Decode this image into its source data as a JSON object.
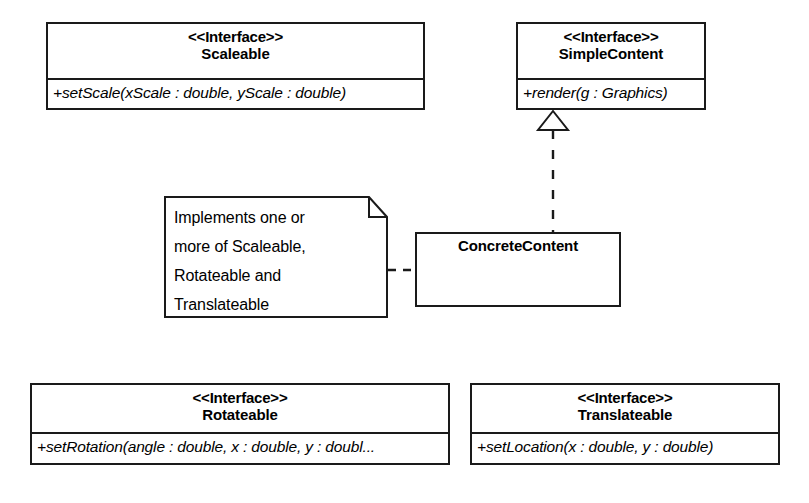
{
  "diagram": {
    "background_color": "#ffffff",
    "line_color": "#1a1a1a"
  },
  "classes": {
    "scaleable": {
      "stereotype": "<<Interface>>",
      "name": "Scaleable",
      "members": [
        "+setScale(xScale : double, yScale : double)"
      ]
    },
    "simple_content": {
      "stereotype": "<<Interface>>",
      "name": "SimpleContent",
      "members": [
        "+render(g : Graphics)"
      ]
    },
    "concrete_content": {
      "stereotype": "",
      "name": "ConcreteContent",
      "members": []
    },
    "rotateable": {
      "stereotype": "<<Interface>>",
      "name": "Rotateable",
      "members": [
        "+setRotation(angle : double, x : double, y : doubl..."
      ]
    },
    "translateable": {
      "stereotype": "<<Interface>>",
      "name": "Translateable",
      "members": [
        "+setLocation(x : double, y : double)"
      ]
    }
  },
  "note": {
    "lines": [
      "Implements one or",
      "more of Scaleable,",
      "Rotateable and",
      "Translateable"
    ]
  },
  "relationships": [
    {
      "type": "realization",
      "from": "ConcreteContent",
      "to": "SimpleContent",
      "line_style": "dashed",
      "arrowhead": "hollow-triangle"
    },
    {
      "type": "note-anchor",
      "from": "note",
      "to": "ConcreteContent",
      "line_style": "dashed",
      "arrowhead": "none"
    }
  ]
}
